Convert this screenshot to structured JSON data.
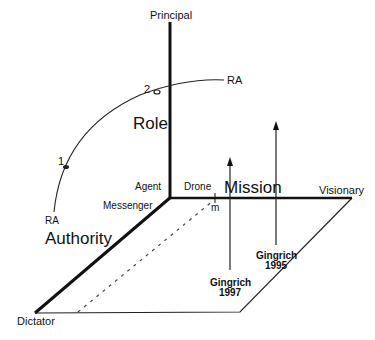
{
  "axes": {
    "vertical": {
      "label": "Principal",
      "axis_name": "Role"
    },
    "horizontal": {
      "label": "Visionary",
      "axis_name": "Mission",
      "origin_label": "Drone"
    },
    "diagonal": {
      "label": "Dictator",
      "axis_name": "Authority",
      "origin_label": "Messenger"
    },
    "origin": {
      "label": "Agent"
    }
  },
  "arc": {
    "start_label": "RA",
    "end_label": "RA",
    "points": [
      {
        "label": "1"
      },
      {
        "label": "2"
      }
    ]
  },
  "marker": {
    "label": "m"
  },
  "arrows": [
    {
      "line1": "Gingrich",
      "line2": "1997"
    },
    {
      "line1": "Gingrich",
      "line2": "1995"
    }
  ],
  "colors": {
    "ink": "#111111",
    "background": "#ffffff"
  }
}
